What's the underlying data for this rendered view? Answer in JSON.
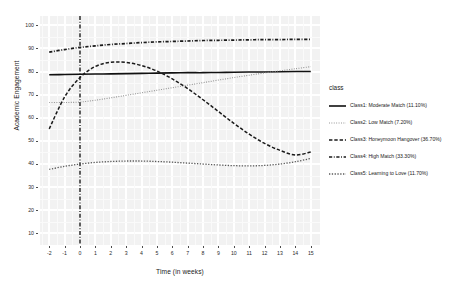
{
  "chart_data": {
    "type": "line",
    "title": "",
    "xlabel": "Time (in weeks)",
    "ylabel": "Academic Engagement",
    "xlim": [
      -2.6,
      15.6
    ],
    "ylim": [
      5,
      104
    ],
    "grid": true,
    "legend_position": "right",
    "legend_title": "class",
    "x_ticks": [
      "-2",
      "-1",
      "0",
      "1",
      "2",
      "3",
      "4",
      "5",
      "6",
      "7",
      "8",
      "9",
      "10",
      "11",
      "12",
      "13",
      "14",
      "15"
    ],
    "y_ticks": [
      "10",
      "20",
      "30",
      "40",
      "50",
      "60",
      "70",
      "80",
      "90",
      "100"
    ],
    "annotations": [
      {
        "name": "reference-line",
        "type": "vline",
        "x": 0,
        "style": "dash-dot",
        "color": "#1a1a1a"
      }
    ],
    "x": [
      -2,
      -1,
      0,
      1,
      2,
      3,
      4,
      5,
      6,
      7,
      8,
      9,
      10,
      11,
      12,
      13,
      14,
      15
    ],
    "series": [
      {
        "name": "Class1: Moderate Match (11.10%)",
        "short": "Class1",
        "dash": "solid",
        "color": "#111111",
        "width": 1.6,
        "values": [
          78.6,
          78.7,
          78.8,
          78.9,
          79.0,
          79.1,
          79.2,
          79.3,
          79.4,
          79.5,
          79.5,
          79.6,
          79.7,
          79.8,
          79.8,
          79.9,
          80.0,
          80.0
        ]
      },
      {
        "name": "Class2: Low Match (7.20%)",
        "short": "Class2",
        "dash": "fine-dotted",
        "color": "#8c8c8c",
        "width": 1.1,
        "values": [
          66.6,
          66.6,
          66.8,
          67.6,
          68.6,
          69.7,
          70.8,
          71.9,
          73.0,
          74.1,
          75.2,
          76.3,
          77.4,
          78.4,
          79.4,
          80.3,
          81.2,
          82.1
        ]
      },
      {
        "name": "Class3: Honeymoon Hangover (36.70%)",
        "short": "Class3",
        "dash": "long-dash",
        "color": "#1a1a1a",
        "width": 1.5,
        "values": [
          55.2,
          69.0,
          77.4,
          82.2,
          84.0,
          83.9,
          82.6,
          80.2,
          76.8,
          72.6,
          67.8,
          62.7,
          57.6,
          52.9,
          48.9,
          45.9,
          43.9,
          45.2
        ]
      },
      {
        "name": "Class4: High Match (33.30%)",
        "short": "Class4",
        "dash": "dash-dot",
        "color": "#1a1a1a",
        "width": 1.7,
        "values": [
          88.4,
          89.5,
          90.4,
          91.1,
          91.7,
          92.1,
          92.5,
          92.8,
          93.0,
          93.2,
          93.4,
          93.5,
          93.6,
          93.7,
          93.8,
          93.8,
          93.9,
          93.9
        ]
      },
      {
        "name": "Class5: Learning to Love (11.70%)",
        "short": "Class5",
        "dash": "dotted",
        "color": "#595959",
        "width": 1.3,
        "values": [
          37.7,
          39.0,
          40.0,
          40.7,
          41.1,
          41.3,
          41.3,
          41.1,
          40.8,
          40.4,
          40.0,
          39.6,
          39.3,
          39.2,
          39.4,
          40.0,
          41.0,
          42.4
        ]
      }
    ]
  }
}
